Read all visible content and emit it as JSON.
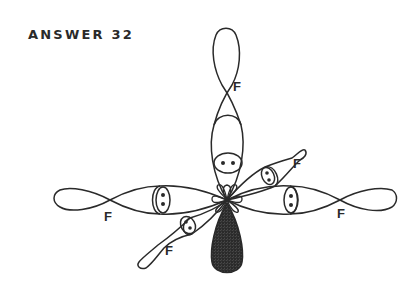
{
  "title": "ANSWER 32",
  "diagram": {
    "type": "orbital-hybridization",
    "central_atom": {
      "label": "",
      "x": 227,
      "y": 200
    },
    "colors": {
      "stroke": "#2a2a2a",
      "lone_pair_fill": "#9a9a9a",
      "background": "#ffffff"
    },
    "bonds": [
      {
        "id": "top",
        "direction": "up",
        "ligand_label": "F",
        "label_pos": [
          236,
          92
        ],
        "pair_pos": [
          228,
          163
        ]
      },
      {
        "id": "left",
        "direction": "left",
        "ligand_label": "F",
        "label_pos": [
          104,
          221
        ],
        "pair_pos": [
          163,
          200
        ]
      },
      {
        "id": "right",
        "direction": "right",
        "ligand_label": "F",
        "label_pos": [
          337,
          218
        ],
        "pair_pos": [
          290,
          200
        ]
      },
      {
        "id": "upper-right",
        "direction": "up-right",
        "ligand_label": "F",
        "label_pos": [
          293,
          167
        ],
        "pair_pos": [
          268,
          176
        ]
      },
      {
        "id": "lower-left",
        "direction": "down-left",
        "ligand_label": "F",
        "label_pos": [
          165,
          254
        ],
        "pair_pos": [
          188,
          225
        ]
      }
    ],
    "lone_pair": {
      "direction": "down",
      "shaded": true
    }
  }
}
